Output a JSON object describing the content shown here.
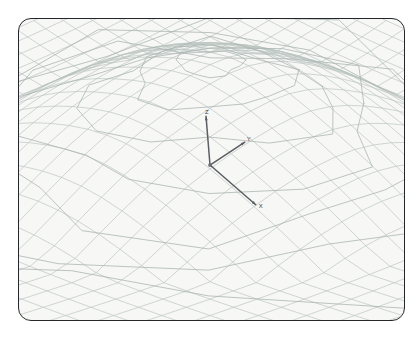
{
  "window": {
    "title": "3D Mesh Wireframe Viewport",
    "background_color": "#ffffff"
  },
  "viewport": {
    "name": "3d-wireframe-viewport",
    "background_color": "#f7f7f6",
    "border_color": "#24262a",
    "border_radius_px": 13,
    "x": 18,
    "y": 18,
    "width": 387,
    "height": 303
  },
  "render": {
    "mesh_line_color": "#b9c2c0",
    "mesh_ring_color": "#aab4b2",
    "mesh_line_width": 0.7,
    "ring_line_width": 0.85,
    "axis_color": "#5a5d62",
    "axis_line_width": 1.5,
    "origin_marker_color": "#6b6e73",
    "shading": "none",
    "projection": "perspective"
  },
  "axes": {
    "origin": {
      "x": 210,
      "y": 165
    },
    "items": [
      {
        "name": "z-axis",
        "label": "Z",
        "tip_x": 206,
        "tip_y": 116,
        "label_x": 205,
        "label_y": 114
      },
      {
        "name": "y-axis",
        "label": "Y",
        "tip_x": 245,
        "tip_y": 142,
        "label_x": 247,
        "label_y": 141
      },
      {
        "name": "x-axis",
        "label": "X",
        "tip_x": 256,
        "tip_y": 205,
        "label_x": 259,
        "label_y": 208
      }
    ]
  },
  "chart_data": {
    "type": "surface-wireframe",
    "title": "",
    "xlabel": "X",
    "ylabel": "Y",
    "zlabel": "Z",
    "grid": true,
    "legend": false,
    "ring_count": 7,
    "radial_segments": 14,
    "peak_screen": {
      "x": 206,
      "y": 71
    },
    "rings": [
      {
        "index": 0,
        "label": "ring-0-summit",
        "radius": 0.1,
        "height": 1.0
      },
      {
        "index": 1,
        "label": "ring-1",
        "radius": 0.24,
        "height": 0.86
      },
      {
        "index": 2,
        "label": "ring-2",
        "radius": 0.38,
        "height": 0.68
      },
      {
        "index": 3,
        "label": "ring-3",
        "radius": 0.54,
        "height": 0.48
      },
      {
        "index": 4,
        "label": "ring-4",
        "radius": 0.7,
        "height": 0.3
      },
      {
        "index": 5,
        "label": "ring-5",
        "radius": 0.86,
        "height": 0.14
      },
      {
        "index": 6,
        "label": "ring-6-base",
        "radius": 1.0,
        "height": 0.0
      }
    ]
  }
}
